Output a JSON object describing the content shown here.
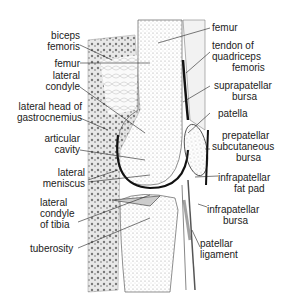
{
  "diagram": {
    "labels_left": [
      {
        "id": "biceps-femoris",
        "lines": [
          "biceps",
          "femoris"
        ]
      },
      {
        "id": "femur-left",
        "lines": [
          "femur"
        ]
      },
      {
        "id": "lateral-condyle",
        "lines": [
          "lateral",
          "condyle"
        ]
      },
      {
        "id": "lateral-head-gastrocnemius",
        "lines": [
          "lateral head of",
          "gastrocnemius"
        ]
      },
      {
        "id": "articular-cavity",
        "lines": [
          "articular",
          "cavity"
        ]
      },
      {
        "id": "lateral-meniscus",
        "lines": [
          "lateral",
          "meniscus"
        ]
      },
      {
        "id": "lateral-condyle-tibia",
        "lines": [
          "lateral",
          "condyle",
          "of tibia"
        ]
      },
      {
        "id": "tuberosity",
        "lines": [
          "tuberosity"
        ]
      }
    ],
    "labels_right": [
      {
        "id": "femur-right",
        "lines": [
          "femur"
        ]
      },
      {
        "id": "tendon-quadriceps",
        "lines": [
          "tendon of",
          "quadriceps",
          "femoris"
        ]
      },
      {
        "id": "suprapatellar-bursa",
        "lines": [
          "suprapatellar",
          "bursa"
        ]
      },
      {
        "id": "patella",
        "lines": [
          "patella"
        ]
      },
      {
        "id": "prepatellar-bursa",
        "lines": [
          "prepatellar",
          "subcutaneous",
          "bursa"
        ]
      },
      {
        "id": "infrapatellar-fat-pad",
        "lines": [
          "infrapatellar",
          "fat pad"
        ]
      },
      {
        "id": "infrapatellar-bursa",
        "lines": [
          "infrapatellar",
          "bursa"
        ]
      },
      {
        "id": "patellar-ligament",
        "lines": [
          "patellar",
          "ligament"
        ]
      }
    ]
  }
}
